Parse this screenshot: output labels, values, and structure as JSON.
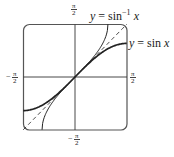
{
  "chart_data": {
    "type": "line",
    "title": "",
    "xlabel": "",
    "ylabel": "",
    "xlim": [
      -1.5708,
      1.5708
    ],
    "ylim": [
      -1.5708,
      1.5708
    ],
    "grid": false,
    "axes": "centered",
    "x_ticks": [
      {
        "value": -1.5708,
        "label": "−π/2"
      },
      {
        "value": 1.5708,
        "label": "π/2"
      }
    ],
    "y_ticks": [
      {
        "value": 1.5708,
        "label": "π/2"
      },
      {
        "value": -1.5708,
        "label": "−π/2"
      }
    ],
    "series": [
      {
        "name": "y = sin x",
        "style": "solid-thick",
        "domain": [
          -1.5708,
          1.5708
        ],
        "x": [
          -1.5708,
          -1.2,
          -0.8,
          -0.4,
          0,
          0.4,
          0.8,
          1.2,
          1.5708
        ],
        "y": [
          -1.0,
          -0.932,
          -0.717,
          -0.389,
          0,
          0.389,
          0.717,
          0.932,
          1.0
        ]
      },
      {
        "name": "y = sin⁻¹ x",
        "style": "solid-thin",
        "domain": [
          -1,
          1
        ],
        "x": [
          -1.0,
          -0.9,
          -0.6,
          -0.3,
          0,
          0.3,
          0.6,
          0.9,
          1.0
        ],
        "y": [
          -1.5708,
          -1.1198,
          -0.6435,
          -0.3047,
          0,
          0.3047,
          0.6435,
          1.1198,
          1.5708
        ]
      },
      {
        "name": "y = x",
        "style": "dashed",
        "domain": [
          -1.5708,
          1.5708
        ],
        "x": [
          -1.5708,
          1.5708
        ],
        "y": [
          -1.5708,
          1.5708
        ]
      }
    ],
    "annotations": [
      {
        "text": "y = sin⁻¹ x",
        "near": "top-right of arcsin curve"
      },
      {
        "text": "y = sin x",
        "near": "right end of sine curve"
      }
    ]
  },
  "labels": {
    "arcsin": {
      "y": "y",
      "eq": " = sin",
      "sup": "−1",
      "x": " x"
    },
    "sin": {
      "y": "y",
      "eq": " = sin ",
      "x": "x"
    },
    "tick_num": "π",
    "tick_den": "2",
    "minus": "−"
  },
  "colors": {
    "curve": "#222222",
    "frame": "#555555",
    "axis": "#333333"
  }
}
